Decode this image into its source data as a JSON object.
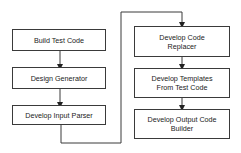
{
  "diagram": {
    "type": "flowchart",
    "left_column": [
      {
        "id": "n1",
        "label": "Build Test Code"
      },
      {
        "id": "n2",
        "label": "Design Generator"
      },
      {
        "id": "n3",
        "label": "Develop Input Parser"
      }
    ],
    "right_column": [
      {
        "id": "n4",
        "label": "Develop Code\nReplacer"
      },
      {
        "id": "n5",
        "label": "Develop Templates\nFrom Test Code"
      },
      {
        "id": "n6",
        "label": "Develop Output Code\nBuilder"
      }
    ],
    "edges": [
      {
        "from": "n1",
        "to": "n2"
      },
      {
        "from": "n2",
        "to": "n3"
      },
      {
        "from": "n3",
        "to": "n4"
      },
      {
        "from": "n4",
        "to": "n5"
      },
      {
        "from": "n5",
        "to": "n6"
      }
    ],
    "colors": {
      "stroke": "#3a3a3a",
      "fill": "#ffffff",
      "text": "#222222"
    }
  }
}
